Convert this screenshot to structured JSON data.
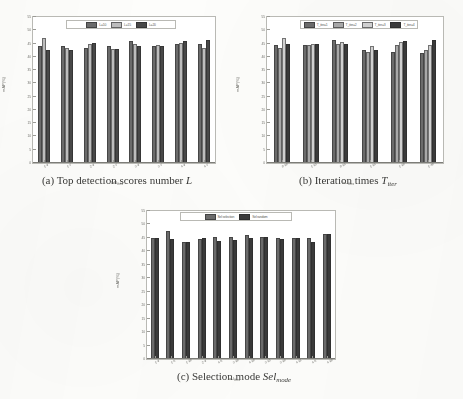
{
  "figure": {
    "background": "#fdfdfb",
    "panels": [
      "a",
      "b",
      "c"
    ]
  },
  "colors": {
    "series1": "#6b6b6b",
    "series2": "#bdbdbd",
    "series3": "#484848",
    "series4": "#3a3a3a",
    "axis": "#7d7d78",
    "tick_text": "#6e6e69"
  },
  "panel_a": {
    "caption_prefix": "(a) Top detection scores number",
    "caption_symbol": "L",
    "chart_data": {
      "type": "bar",
      "title": "",
      "xlabel_main": "IoU",
      "xlabel_sub": "thres",
      "ylabel": "mAP(%)",
      "ylim": [
        0,
        55
      ],
      "yticks": [
        0,
        5,
        10,
        15,
        20,
        25,
        30,
        35,
        40,
        45,
        50,
        55
      ],
      "ytick_labels": [
        "0",
        "5",
        "10",
        "15",
        "20",
        "25",
        "30",
        "35",
        "40",
        "45",
        "50",
        "55"
      ],
      "grid": false,
      "legend_position": "top-center",
      "categories": [
        "1-9",
        "1-7",
        "2-9",
        "2-7",
        "3-9",
        "3-7",
        "4-9",
        "4-7"
      ],
      "series": [
        {
          "name": "L=10",
          "color": "#6b6b6b",
          "values": [
            44.0,
            44.0,
            43.5,
            44.0,
            46.0,
            44.2,
            45.0,
            45.0
          ]
        },
        {
          "name": "L=15",
          "color": "#bdbdbd",
          "values": [
            47.0,
            43.5,
            45.0,
            42.8,
            45.0,
            44.5,
            45.2,
            43.2
          ]
        },
        {
          "name": "L=20",
          "color": "#484848",
          "values": [
            42.5,
            42.5,
            45.2,
            42.8,
            44.2,
            44.0,
            46.0,
            46.2
          ]
        }
      ]
    }
  },
  "panel_b": {
    "caption_prefix": "(b) Iteration times",
    "caption_symbol": "T",
    "caption_symbol_sub": "iter",
    "chart_data": {
      "type": "bar",
      "title": "",
      "xlabel_main": "IoU",
      "xlabel_sub": "thres",
      "ylabel": "mAP(%)",
      "ylim": [
        0,
        55
      ],
      "yticks": [
        0,
        5,
        10,
        15,
        20,
        25,
        30,
        35,
        40,
        45,
        50,
        55
      ],
      "ytick_labels": [
        "0",
        "5",
        "10",
        "15",
        "20",
        "25",
        "30",
        "35",
        "40",
        "45",
        "50",
        "55"
      ],
      "grid": false,
      "legend_position": "top-center",
      "categories": [
        "0-10",
        "1-12",
        "0-15",
        "1-15",
        "1-20",
        "1-30"
      ],
      "series": [
        {
          "name": "T_iter=1",
          "color": "#6b6b6b",
          "values": [
            44.5,
            44.5,
            46.5,
            42.5,
            42.0,
            41.5
          ]
        },
        {
          "name": "T_iter=2",
          "color": "#a8a8a8",
          "values": [
            43.5,
            44.5,
            45.0,
            42.0,
            44.5,
            42.5
          ]
        },
        {
          "name": "T_iter=3",
          "color": "#d0d0d0",
          "values": [
            47.0,
            45.0,
            45.5,
            44.0,
            45.5,
            44.5
          ]
        },
        {
          "name": "T_iter=4",
          "color": "#3a3a3a",
          "values": [
            45.0,
            45.0,
            45.0,
            42.5,
            46.0,
            46.5
          ]
        }
      ]
    }
  },
  "panel_c": {
    "caption_prefix": "(c) Selection mode",
    "caption_symbol": "Sel",
    "caption_symbol_sub": "mode",
    "chart_data": {
      "type": "bar",
      "title": "",
      "xlabel_main": "IoU",
      "xlabel_sub": "thres",
      "ylabel": "mAP(%)",
      "ylim": [
        0,
        55
      ],
      "yticks": [
        0,
        5,
        10,
        15,
        20,
        25,
        30,
        35,
        40,
        45,
        50,
        55
      ],
      "ytick_labels": [
        "0",
        "5",
        "10",
        "15",
        "20",
        "25",
        "30",
        "35",
        "40",
        "45",
        "50",
        "55"
      ],
      "grid": false,
      "legend_position": "top-center",
      "categories": [
        "1-9",
        "1-5",
        "1-20",
        "2-9",
        "4-5",
        "3-20",
        "4-10",
        "3-12",
        "3-20",
        "4-11",
        "4-5",
        "4-20"
      ],
      "series": [
        {
          "name": "Sel selection",
          "color": "#6b6b6b",
          "values": [
            45.0,
            47.5,
            43.5,
            44.5,
            45.5,
            45.5,
            46.0,
            45.5,
            45.0,
            45.0,
            45.0,
            46.5
          ]
        },
        {
          "name": "Sel random",
          "color": "#3a3a3a",
          "values": [
            45.0,
            44.5,
            43.5,
            45.0,
            44.0,
            44.2,
            45.0,
            45.2,
            44.5,
            45.0,
            43.5,
            46.5
          ]
        }
      ]
    }
  }
}
